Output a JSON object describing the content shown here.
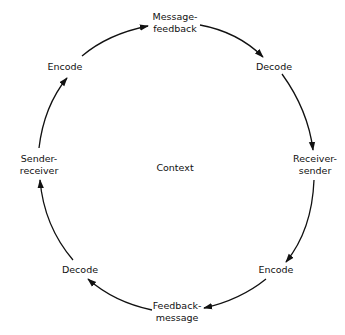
{
  "diagram": {
    "type": "cyclic communication model",
    "center_label": "Context",
    "nodes": [
      {
        "id": "message_feedback",
        "line1": "Message-",
        "line2": "feedback"
      },
      {
        "id": "decode_top",
        "line1": "Decode"
      },
      {
        "id": "receiver_sender",
        "line1": "Receiver-",
        "line2": "sender"
      },
      {
        "id": "encode_bottom",
        "line1": "Encode"
      },
      {
        "id": "feedback_message",
        "line1": "Feedback-",
        "line2": "message"
      },
      {
        "id": "decode_bottom",
        "line1": "Decode"
      },
      {
        "id": "sender_receiver",
        "line1": "Sender-",
        "line2": "receiver"
      },
      {
        "id": "encode_top",
        "line1": "Encode"
      }
    ],
    "edges": [
      {
        "from": "encode_top",
        "to": "message_feedback"
      },
      {
        "from": "message_feedback",
        "to": "decode_top"
      },
      {
        "from": "decode_top",
        "to": "receiver_sender"
      },
      {
        "from": "receiver_sender",
        "to": "encode_bottom"
      },
      {
        "from": "encode_bottom",
        "to": "feedback_message"
      },
      {
        "from": "feedback_message",
        "to": "decode_bottom"
      },
      {
        "from": "decode_bottom",
        "to": "sender_receiver"
      },
      {
        "from": "sender_receiver",
        "to": "encode_top"
      }
    ],
    "direction": "clockwise",
    "line_color": "#111111"
  }
}
